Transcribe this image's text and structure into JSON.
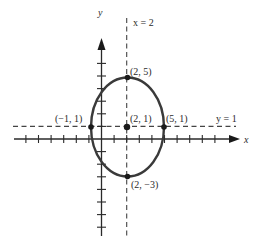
{
  "diagram": {
    "type": "ellipse-graph",
    "axes": {
      "x_label": "x",
      "y_label": "y"
    },
    "guide_lines": {
      "vertical_label": "x = 2",
      "horizontal_label": "y = 1"
    },
    "ellipse": {
      "center": [
        2,
        1
      ],
      "semi_axis_x": 3,
      "semi_axis_y": 4
    },
    "points": [
      {
        "id": "left-vertex",
        "coords": [
          -1,
          1
        ],
        "label": "(−1, 1)"
      },
      {
        "id": "center",
        "coords": [
          2,
          1
        ],
        "label": "(2, 1)"
      },
      {
        "id": "right-vertex",
        "coords": [
          5,
          1
        ],
        "label": "(5, 1)"
      },
      {
        "id": "top-vertex",
        "coords": [
          2,
          5
        ],
        "label": "(2, 5)"
      },
      {
        "id": "bottom-vertex",
        "coords": [
          2,
          -3
        ],
        "label": "(2, −3)"
      }
    ],
    "colors": {
      "curve": "#3a3a3a",
      "axis": "#2a2a2a",
      "dashed": "#444444"
    }
  }
}
